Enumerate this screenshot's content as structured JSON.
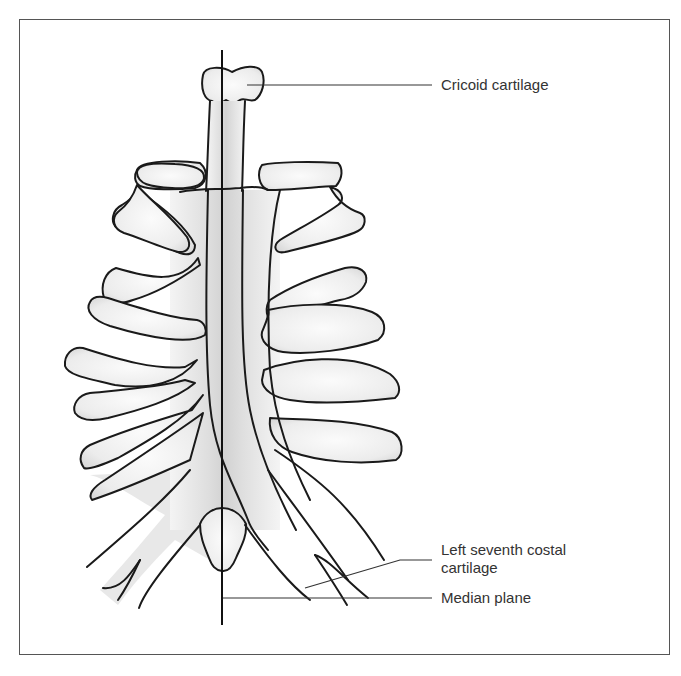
{
  "figure": {
    "type": "anatomical line drawing",
    "labels": [
      {
        "id": "cricoid",
        "text": "Cricoid cartilage"
      },
      {
        "id": "seventh_costal_line1",
        "text": "Left seventh costal"
      },
      {
        "id": "seventh_costal_line2",
        "text": "cartilage"
      },
      {
        "id": "median",
        "text": "Median plane"
      }
    ],
    "colors": {
      "outline": "#1a1a1a",
      "fill_light": "#f7f7f7",
      "fill_shade": "#d6d6d6",
      "frame": "#555555",
      "label_text": "#333333"
    }
  }
}
